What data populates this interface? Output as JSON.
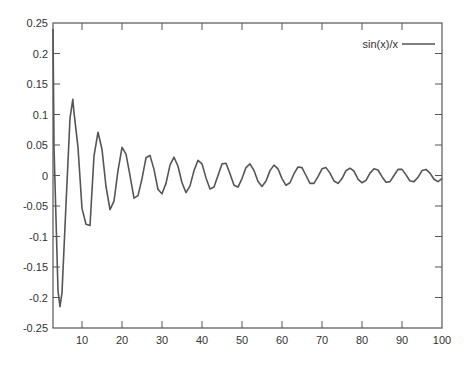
{
  "chart_data": {
    "type": "line",
    "title": "",
    "xlabel": "",
    "ylabel": "",
    "xlim": [
      2.75,
      100
    ],
    "ylim": [
      -0.25,
      0.25
    ],
    "grid": false,
    "legend_position": "top-right",
    "x_ticks": [
      10,
      20,
      30,
      40,
      50,
      60,
      70,
      80,
      90,
      100
    ],
    "x_tick_labels": [
      "10",
      "20",
      "30",
      "40",
      "50",
      "60",
      "70",
      "80",
      "90",
      "100"
    ],
    "y_ticks": [
      0.25,
      0.2,
      0.15,
      0.1,
      0.05,
      0,
      -0.05,
      -0.1,
      -0.15,
      -0.2,
      -0.25
    ],
    "y_tick_labels": [
      "0.25",
      "0.2",
      "0.15",
      "0.1",
      "0.05",
      "0",
      "-0.05",
      "-0.1",
      "-0.15",
      "-0.2",
      "-0.25"
    ],
    "series": [
      {
        "name": "sin(x)/x",
        "color": "#555555",
        "x": [
          2.75,
          3,
          4,
          4.5,
          5,
          6,
          7,
          7.7,
          8,
          9,
          10,
          11,
          12,
          13,
          14,
          15,
          16,
          17,
          18,
          19,
          20,
          21,
          22,
          23,
          24,
          25,
          26,
          27,
          28,
          29,
          30,
          31,
          32,
          33,
          34,
          35,
          36,
          37,
          38,
          39,
          40,
          41,
          42,
          43,
          44,
          45,
          46,
          47,
          48,
          49,
          50,
          51,
          52,
          53,
          54,
          55,
          56,
          57,
          58,
          59,
          60,
          61,
          62,
          63,
          64,
          65,
          66,
          67,
          68,
          69,
          70,
          71,
          72,
          73,
          74,
          75,
          76,
          77,
          78,
          79,
          80,
          81,
          82,
          83,
          84,
          85,
          86,
          87,
          88,
          89,
          90,
          91,
          92,
          93,
          94,
          95,
          96,
          97,
          98,
          99,
          100
        ],
        "values": [
          0.24,
          0.047,
          -0.189,
          -0.215,
          -0.192,
          -0.047,
          0.094,
          0.125,
          0.103,
          0.046,
          -0.054,
          -0.08,
          -0.082,
          0.032,
          0.071,
          0.043,
          -0.018,
          -0.056,
          -0.042,
          0.008,
          0.046,
          0.035,
          -0.0004,
          -0.037,
          -0.033,
          -0.005,
          0.029,
          0.033,
          0.01,
          -0.023,
          -0.03,
          -0.013,
          0.017,
          0.03,
          0.015,
          -0.012,
          -0.028,
          -0.017,
          0.008,
          0.025,
          0.019,
          -0.004,
          -0.022,
          -0.019,
          0.0,
          0.019,
          0.02,
          0.003,
          -0.016,
          -0.019,
          -0.005,
          0.013,
          0.019,
          0.008,
          -0.01,
          -0.018,
          -0.009,
          0.008,
          0.017,
          0.011,
          -0.005,
          -0.016,
          -0.012,
          0.003,
          0.014,
          0.013,
          0.0,
          -0.013,
          -0.013,
          -0.002,
          0.011,
          0.013,
          0.004,
          -0.009,
          -0.013,
          -0.005,
          0.008,
          0.012,
          0.007,
          -0.006,
          -0.012,
          -0.008,
          0.004,
          0.011,
          0.009,
          -0.002,
          -0.011,
          -0.01,
          0.0,
          0.01,
          0.01,
          0.001,
          -0.009,
          -0.01,
          -0.003,
          0.008,
          0.01,
          0.004,
          -0.006,
          -0.01,
          -0.005
        ]
      }
    ]
  },
  "legend": {
    "label": "sin(x)/x"
  }
}
